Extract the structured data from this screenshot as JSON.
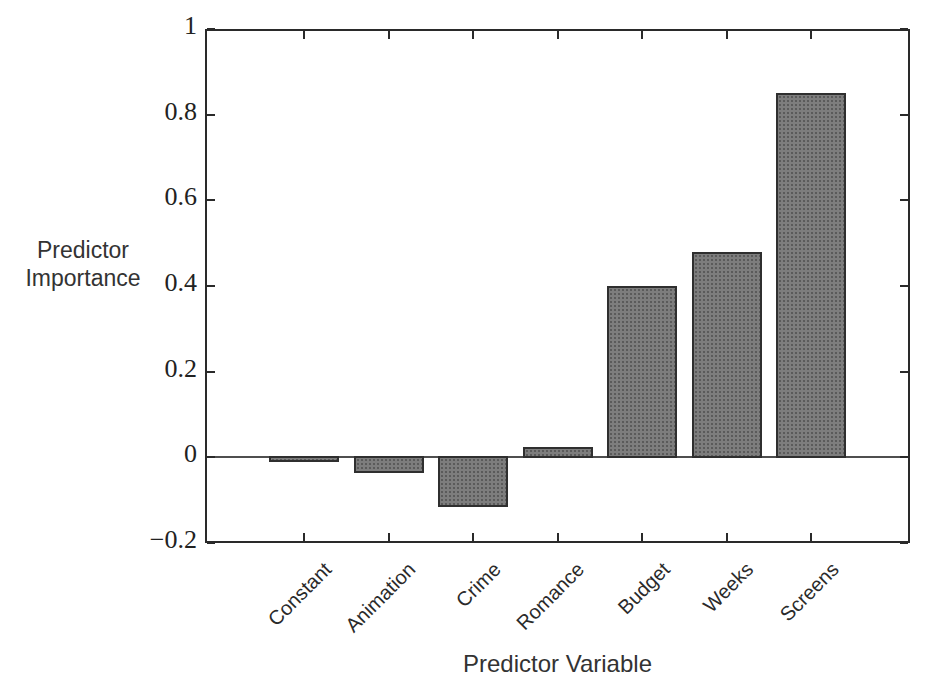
{
  "chart_data": {
    "type": "bar",
    "title": "",
    "categories": [
      "Constant",
      "Animation",
      "Crime",
      "Romance",
      "Budget",
      "Weeks",
      "Screens"
    ],
    "values": [
      -0.005,
      -0.03,
      -0.11,
      0.025,
      0.4,
      0.48,
      0.85
    ],
    "xlabel": "Predictor Variable",
    "ylabel": "Predictor Importance",
    "ylabel_lines": [
      "Predictor",
      "Importance"
    ],
    "ylim": [
      -0.2,
      1
    ],
    "yticks": [
      1,
      0.8,
      0.6,
      0.4,
      0.2,
      0,
      -0.2
    ],
    "ytick_labels": [
      "1",
      "0.8",
      "0.6",
      "0.4",
      "0.2",
      "0",
      "−0.2"
    ],
    "grid": false,
    "legend": "none",
    "zero_line": true,
    "bar_color": "#7d7d7d",
    "bar_border_color": "#2f2f2f",
    "axis_color": "#2a2a2a"
  }
}
